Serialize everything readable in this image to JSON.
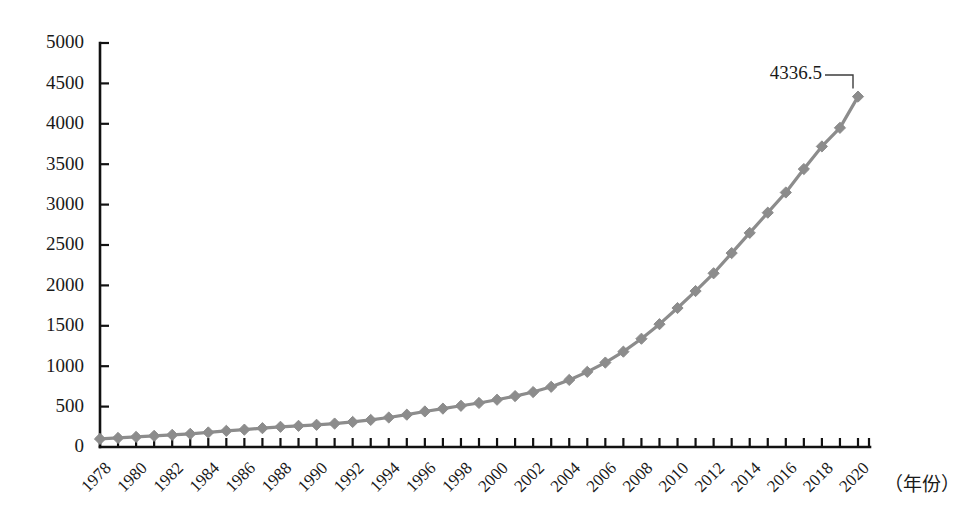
{
  "chart_data": {
    "type": "line",
    "title": "",
    "subtitle": "",
    "xlabel": "（年份）",
    "ylabel": "",
    "xlim": [
      1978,
      2020
    ],
    "ylim": [
      0,
      5000
    ],
    "grid": false,
    "legend": false,
    "legend_position": "none",
    "y_ticks": [
      0,
      500,
      1000,
      1500,
      2000,
      2500,
      3000,
      3500,
      4000,
      4500,
      5000
    ],
    "y_tick_labels": [
      "0",
      "500",
      "1000",
      "1500",
      "2000",
      "2500",
      "3000",
      "3500",
      "4000",
      "4500",
      "5000"
    ],
    "x_tick_labels": [
      "1978",
      "1980",
      "1982",
      "1984",
      "1986",
      "1988",
      "1990",
      "1992",
      "1994",
      "1996",
      "1998",
      "2000",
      "2002",
      "2004",
      "2006",
      "2008",
      "2010",
      "2012",
      "2014",
      "2016",
      "2018",
      "2020"
    ],
    "x_tick_values": [
      1978,
      1980,
      1982,
      1984,
      1986,
      1988,
      1990,
      1992,
      1994,
      1996,
      1998,
      2000,
      2002,
      2004,
      2006,
      2008,
      2010,
      2012,
      2014,
      2016,
      2018,
      2020
    ],
    "marker": "diamond",
    "line_color": "#8c8c8c",
    "marker_color": "#8c8c8c",
    "axis_color": "#111111",
    "text_color": "#1a1a1a",
    "x": [
      1978,
      1979,
      1980,
      1981,
      1982,
      1983,
      1984,
      1985,
      1986,
      1987,
      1988,
      1989,
      1990,
      1991,
      1992,
      1993,
      1994,
      1995,
      1996,
      1997,
      1998,
      1999,
      2000,
      2001,
      2002,
      2003,
      2004,
      2005,
      2006,
      2007,
      2008,
      2009,
      2010,
      2011,
      2012,
      2013,
      2014,
      2015,
      2016,
      2017,
      2018,
      2019,
      2020
    ],
    "values": [
      100,
      112,
      125,
      138,
      150,
      163,
      180,
      200,
      215,
      233,
      250,
      262,
      275,
      290,
      310,
      335,
      365,
      400,
      440,
      475,
      510,
      545,
      585,
      630,
      680,
      745,
      830,
      930,
      1045,
      1180,
      1340,
      1520,
      1720,
      1930,
      2150,
      2400,
      2650,
      2900,
      3150,
      3440,
      3720,
      3950,
      4336.5
    ],
    "annotations": [
      {
        "label": "4336.5",
        "x": 2020,
        "y": 4336.5,
        "leader": true
      }
    ]
  }
}
